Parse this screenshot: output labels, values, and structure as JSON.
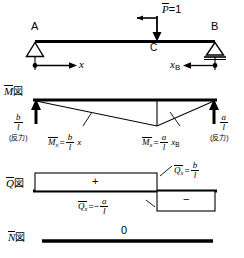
{
  "figure": {
    "type": "influence-line-diagram",
    "colors": {
      "ink": "#000000",
      "background": "#ffffff"
    }
  },
  "beam": {
    "label_a": "A",
    "label_b": "B",
    "label_c": "C",
    "load_label": "P",
    "load_equals": "=1",
    "support_a_type": "pin-support",
    "support_b_type": "roller-support",
    "dim_left": "x",
    "dim_right": "x",
    "dim_right_sub": "B"
  },
  "moment_diagram": {
    "title_sym": "M",
    "title_suffix": "図",
    "reaction_left": {
      "num": "b",
      "den": "l",
      "note": "(反力)"
    },
    "reaction_right": {
      "num": "a",
      "den": "l",
      "note": "(反力)"
    },
    "formula_left": {
      "lhs": "M",
      "lhs_sub": "x",
      "eq": "=",
      "num": "b",
      "den": "l",
      "tail": "x"
    },
    "formula_right": {
      "lhs": "M",
      "lhs_sub": "x",
      "eq": "=",
      "num": "a",
      "den": "l",
      "tail": "x",
      "tail_sub": "B"
    }
  },
  "shear_diagram": {
    "title_sym": "Q",
    "title_suffix": "図",
    "sign_positive": "+",
    "sign_negative": "−",
    "formula_positive": {
      "lhs": "Q",
      "lhs_sub": "x",
      "eq": "=",
      "num": "b",
      "den": "l"
    },
    "formula_negative": {
      "lhs": "Q",
      "lhs_sub": "x",
      "eq": "=−",
      "num": "a",
      "den": "l"
    }
  },
  "axial_diagram": {
    "title_sym": "N",
    "title_suffix": "図",
    "value": "0"
  }
}
